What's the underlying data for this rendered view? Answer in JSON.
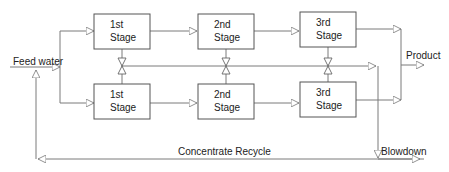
{
  "diagram": {
    "type": "process-flow",
    "inputs": {
      "feed": "Feed water"
    },
    "outputs": {
      "product": "Product",
      "blowdown": "Blowdown"
    },
    "recycle": "Concentrate Recycle",
    "trains": [
      {
        "name": "upper",
        "stages": [
          {
            "line1": "1st",
            "line2": "Stage"
          },
          {
            "line1": "2nd",
            "line2": "Stage"
          },
          {
            "line1": "3rd",
            "line2": "Stage"
          }
        ]
      },
      {
        "name": "lower",
        "stages": [
          {
            "line1": "1st",
            "line2": "Stage"
          },
          {
            "line1": "2nd",
            "line2": "Stage"
          },
          {
            "line1": "3rd",
            "line2": "Stage"
          }
        ]
      }
    ],
    "colors": {
      "line": "#7a7a7a",
      "box_border": "#555555",
      "text": "#222222"
    }
  }
}
